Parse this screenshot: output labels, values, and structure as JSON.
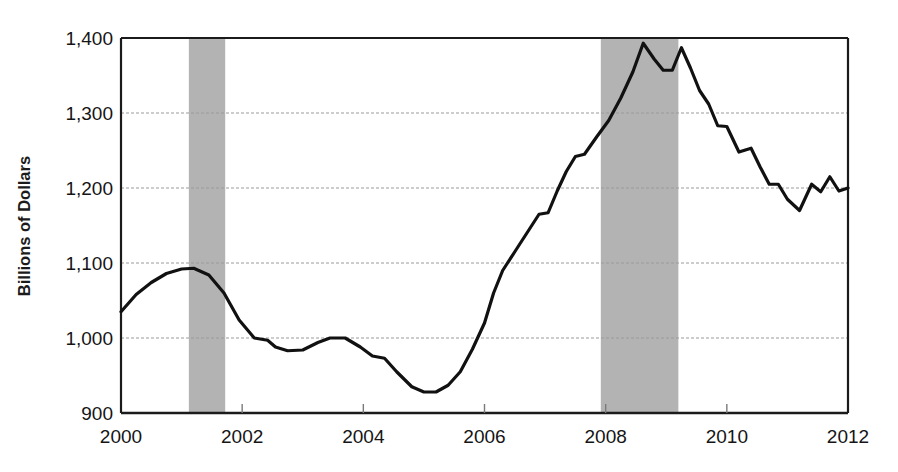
{
  "chart_data": {
    "type": "line",
    "title": "",
    "subtitle": "",
    "xlabel": "",
    "ylabel": "Billions of Dollars",
    "xlim": [
      2000,
      2012
    ],
    "ylim": [
      900,
      1400
    ],
    "grid": true,
    "grid_axis": "y",
    "legend": "none",
    "xticks": [
      2000,
      2002,
      2004,
      2006,
      2008,
      2010,
      2012
    ],
    "xtick_labels": [
      "2000",
      "2002",
      "2004",
      "2006",
      "2008",
      "2010",
      "2012"
    ],
    "yticks": [
      900,
      1000,
      1100,
      1200,
      1300,
      1400
    ],
    "ytick_labels": [
      "900",
      "1,000",
      "1,100",
      "1,200",
      "1,300",
      "1,400"
    ],
    "line_color": "#111111",
    "line_width": 3.2,
    "shaded_band_color": "#b3b3b3",
    "annotations": [
      {
        "name": "recession-band-1",
        "x_start": 2001.12,
        "x_end": 2001.72
      },
      {
        "name": "recession-band-2",
        "x_start": 2007.92,
        "x_end": 2009.2
      }
    ],
    "series": [
      {
        "name": "value",
        "x": [
          2000.0,
          2000.25,
          2000.5,
          2000.75,
          2001.0,
          2001.2,
          2001.45,
          2001.7,
          2001.95,
          2002.2,
          2002.42,
          2002.55,
          2002.75,
          2003.0,
          2003.25,
          2003.45,
          2003.7,
          2003.95,
          2004.15,
          2004.35,
          2004.55,
          2004.8,
          2005.0,
          2005.2,
          2005.4,
          2005.6,
          2005.8,
          2006.0,
          2006.15,
          2006.3,
          2006.5,
          2006.7,
          2006.9,
          2007.05,
          2007.2,
          2007.35,
          2007.5,
          2007.65,
          2007.85,
          2008.05,
          2008.25,
          2008.45,
          2008.62,
          2008.8,
          2008.95,
          2009.1,
          2009.25,
          2009.4,
          2009.55,
          2009.7,
          2009.85,
          2010.0,
          2010.2,
          2010.4,
          2010.55,
          2010.7,
          2010.85,
          2011.0,
          2011.2,
          2011.4,
          2011.55,
          2011.7,
          2011.85,
          2012.0
        ],
        "y": [
          1035,
          1058,
          1074,
          1086,
          1092,
          1093,
          1084,
          1060,
          1024,
          1000,
          997,
          988,
          983,
          984,
          994,
          1000,
          1000,
          988,
          976,
          973,
          955,
          935,
          928,
          928,
          937,
          955,
          985,
          1020,
          1060,
          1090,
          1115,
          1140,
          1165,
          1167,
          1196,
          1222,
          1242,
          1245,
          1268,
          1290,
          1320,
          1355,
          1393,
          1372,
          1357,
          1357,
          1387,
          1360,
          1330,
          1312,
          1283,
          1282,
          1248,
          1253,
          1228,
          1205,
          1205,
          1185,
          1170,
          1205,
          1195,
          1215,
          1196,
          1200
        ]
      }
    ]
  }
}
